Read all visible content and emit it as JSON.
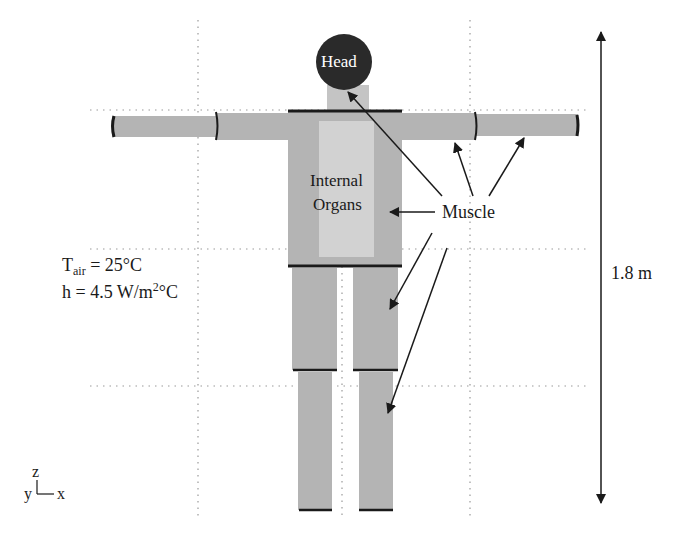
{
  "labels": {
    "head": "Head",
    "internal_organs_line1": "Internal",
    "internal_organs_line2": "Organs",
    "muscle": "Muscle",
    "height": "1.8 m"
  },
  "conditions": {
    "t_air_symbol": "T",
    "t_air_subscript": "air",
    "t_air_value": " = 25°C",
    "h_prefix": "h = 4.5 W/m",
    "h_superscript": "2",
    "h_suffix": "°C"
  },
  "axes": {
    "z": "z",
    "y": "y",
    "x": "x"
  },
  "colors": {
    "body_gray": "#b4b4b4",
    "organ_light": "#d2d2d2",
    "head_dark": "#2a2a2a",
    "line": "#1a1a1a",
    "grid": "#9a9a9a"
  }
}
